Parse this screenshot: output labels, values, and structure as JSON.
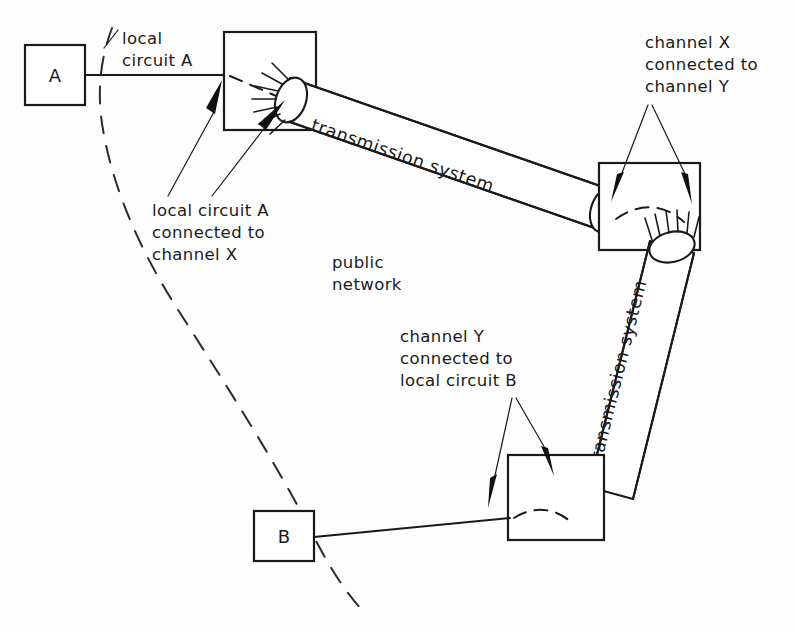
{
  "diagram": {
    "ink_color": "#1a1a1a",
    "background_color": "#fdfdfd"
  },
  "nodes": {
    "terminal_a": "A",
    "terminal_b": "B"
  },
  "labels": {
    "local_circuit_a": {
      "line1": "local",
      "line2": "circuit A"
    },
    "local_circuit_a_connected": {
      "line1": "local circuit A",
      "line2": "connected to",
      "line3": "channel X"
    },
    "channel_x_connected": {
      "line1": "channel X",
      "line2": "connected to",
      "line3": "channel Y"
    },
    "channel_y_connected": {
      "line1": "channel Y",
      "line2": "connected to",
      "line3": "local circuit B"
    },
    "public_network": {
      "line1": "public",
      "line2": "network"
    },
    "transmission_system_upper": "transmission system",
    "transmission_system_lower": "transmission system"
  }
}
